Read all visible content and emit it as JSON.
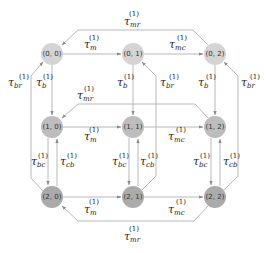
{
  "diagram": {
    "type": "state-transition-graph",
    "node_colors": {
      "row0": "#d4d4d4",
      "row1": "#bdbdbd",
      "row2": "#ababab"
    },
    "edge_color": "#b0b0b0",
    "nodes": [
      {
        "id": "n00",
        "label": "(0, 0)"
      },
      {
        "id": "n01",
        "label": "(0, 1)"
      },
      {
        "id": "n02",
        "label": "(0, 2)"
      },
      {
        "id": "n10",
        "label": "(1, 0)"
      },
      {
        "id": "n11",
        "label": "(1, 1)"
      },
      {
        "id": "n12",
        "label": "(1, 2)"
      },
      {
        "id": "n20",
        "label": "(2, 0)"
      },
      {
        "id": "n21",
        "label": "(2, 1)"
      },
      {
        "id": "n22",
        "label": "(2, 2)"
      }
    ],
    "superscript": "(1)",
    "edge_labels": {
      "top_mr": {
        "tau": "τ",
        "sub": "mr"
      },
      "r0_m": {
        "tau": "τ",
        "sub": "m"
      },
      "r0_mc": {
        "tau": "τ",
        "sub": "mc"
      },
      "left_br": {
        "tau": "τ",
        "sub": "br"
      },
      "c0_b": {
        "tau": "τ",
        "sub": "b"
      },
      "c1_b": {
        "tau": "τ",
        "sub": "b"
      },
      "c1_br": {
        "tau": "τ",
        "sub": "br"
      },
      "c2_b": {
        "tau": "τ",
        "sub": "b"
      },
      "right_br": {
        "tau": "τ",
        "sub": "br"
      },
      "mid_mr": {
        "tau": "τ",
        "sub": "mr"
      },
      "r1_m": {
        "tau": "τ",
        "sub": "m"
      },
      "r1_mc": {
        "tau": "τ",
        "sub": "mc"
      },
      "c0_bc": {
        "tau": "τ",
        "sub": "bc"
      },
      "c0_cb": {
        "tau": "τ",
        "sub": "cb"
      },
      "c1_bc": {
        "tau": "τ",
        "sub": "bc"
      },
      "c1_cb": {
        "tau": "τ",
        "sub": "cb"
      },
      "c2_bc": {
        "tau": "τ",
        "sub": "bc"
      },
      "c2_cb": {
        "tau": "τ",
        "sub": "cb"
      },
      "r2_m": {
        "tau": "τ",
        "sub": "m"
      },
      "r2_mc": {
        "tau": "τ",
        "sub": "mc"
      },
      "bot_mr": {
        "tau": "τ",
        "sub": "mr"
      }
    },
    "edges": [
      {
        "from": "(0, 0)",
        "to": "(0, 1)",
        "label": "τ_m^(1)"
      },
      {
        "from": "(0, 1)",
        "to": "(0, 2)",
        "label": "τ_mc^(1)"
      },
      {
        "from": "(0, 2)",
        "to": "(0, 0)",
        "label": "τ_mr^(1)"
      },
      {
        "from": "(1, 0)",
        "to": "(1, 1)",
        "label": "τ_m^(1)"
      },
      {
        "from": "(1, 1)",
        "to": "(1, 2)",
        "label": "τ_mc^(1)"
      },
      {
        "from": "(1, 2)",
        "to": "(1, 0)",
        "label": "τ_mr^(1)"
      },
      {
        "from": "(2, 0)",
        "to": "(2, 1)",
        "label": "τ_m^(1)"
      },
      {
        "from": "(2, 1)",
        "to": "(2, 2)",
        "label": "τ_mc^(1)"
      },
      {
        "from": "(2, 2)",
        "to": "(2, 0)",
        "label": "τ_mr^(1)"
      },
      {
        "from": "(0, 0)",
        "to": "(1, 0)",
        "label": "τ_b^(1)"
      },
      {
        "from": "(0, 1)",
        "to": "(1, 1)",
        "label": "τ_b^(1)"
      },
      {
        "from": "(0, 2)",
        "to": "(1, 2)",
        "label": "τ_b^(1)"
      },
      {
        "from": "(1, 0)",
        "to": "(2, 0)",
        "label": "τ_bc^(1)"
      },
      {
        "from": "(2, 0)",
        "to": "(1, 0)",
        "label": "τ_cb^(1)"
      },
      {
        "from": "(1, 1)",
        "to": "(2, 1)",
        "label": "τ_bc^(1)"
      },
      {
        "from": "(2, 1)",
        "to": "(1, 1)",
        "label": "τ_cb^(1)"
      },
      {
        "from": "(1, 2)",
        "to": "(2, 2)",
        "label": "τ_bc^(1)"
      },
      {
        "from": "(2, 2)",
        "to": "(1, 2)",
        "label": "τ_cb^(1)"
      },
      {
        "from": "(2, 0)",
        "to": "(0, 0)",
        "label": "τ_br^(1)"
      },
      {
        "from": "(2, 1)",
        "to": "(0, 1)",
        "label": "τ_br^(1)"
      },
      {
        "from": "(2, 2)",
        "to": "(0, 2)",
        "label": "τ_br^(1)"
      }
    ]
  }
}
